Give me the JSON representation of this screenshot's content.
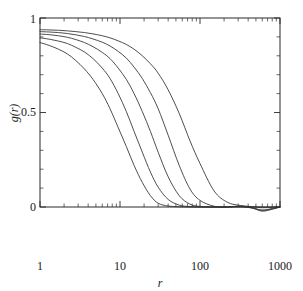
{
  "figure": {
    "background_color": "#ffffff",
    "line_color": "#3a3a3a",
    "axis_color": "#2a2a2a",
    "width": 303,
    "height": 291
  },
  "labels": {
    "xaxis": "r",
    "yaxis": "g(r)",
    "xtick_1": "1",
    "xtick_10": "10",
    "xtick_100": "100",
    "xtick_1000": "1000",
    "ytick_0": "0",
    "ytick_05": "0.5",
    "ytick_1": "1"
  },
  "chart_data": {
    "type": "line",
    "title": "",
    "xlabel": "r",
    "ylabel": "g(r)",
    "xscale": "log",
    "yscale": "linear",
    "xlim": [
      1,
      1000
    ],
    "ylim": [
      -0.07,
      1.0
    ],
    "xticks": [
      1,
      10,
      100,
      1000
    ],
    "xticklabels": [
      "1",
      "10",
      "100",
      "1000"
    ],
    "yticks": [
      0,
      0.5,
      1
    ],
    "yticklabels": [
      "0",
      "0.5",
      "1"
    ],
    "grid": false,
    "legend": null,
    "minor_ticks": true,
    "tick_direction": "in",
    "frame": "box",
    "series": [
      {
        "name": "curve-1",
        "comment": "leftmost / fastest decaying, half-value near r=7",
        "x": [
          1,
          1.3,
          1.7,
          2.2,
          2.8,
          3.6,
          4.6,
          6,
          7.5,
          9.5,
          12,
          15,
          19,
          24,
          30,
          40,
          55,
          75,
          100,
          150,
          220,
          320,
          450,
          600,
          800,
          1000
        ],
        "y": [
          0.87,
          0.855,
          0.835,
          0.81,
          0.775,
          0.73,
          0.675,
          0.6,
          0.52,
          0.42,
          0.32,
          0.22,
          0.13,
          0.06,
          0.02,
          0.005,
          0.001,
          0.0,
          0.0,
          0.0,
          0.0,
          0.0,
          0.0,
          -0.004,
          -0.002,
          0.0
        ]
      },
      {
        "name": "curve-2",
        "comment": "half-value near r=12",
        "x": [
          1,
          1.3,
          1.7,
          2.2,
          2.8,
          3.6,
          4.6,
          6,
          7.5,
          9.5,
          12,
          15,
          19,
          24,
          30,
          40,
          55,
          75,
          100,
          150,
          220,
          320,
          450,
          600,
          800,
          1000
        ],
        "y": [
          0.895,
          0.888,
          0.878,
          0.865,
          0.845,
          0.82,
          0.785,
          0.735,
          0.68,
          0.6,
          0.505,
          0.4,
          0.29,
          0.185,
          0.105,
          0.04,
          0.01,
          0.002,
          0.0,
          0.0,
          0.0,
          0.002,
          -0.005,
          -0.018,
          -0.01,
          0.0
        ]
      },
      {
        "name": "curve-3",
        "comment": "half-value near r=22",
        "x": [
          1,
          1.3,
          1.7,
          2.2,
          2.8,
          3.6,
          4.6,
          6,
          7.5,
          9.5,
          12,
          15,
          19,
          24,
          30,
          40,
          55,
          75,
          100,
          150,
          220,
          320,
          450,
          600,
          800,
          1000
        ],
        "y": [
          0.915,
          0.912,
          0.906,
          0.898,
          0.886,
          0.87,
          0.848,
          0.818,
          0.785,
          0.735,
          0.675,
          0.6,
          0.505,
          0.4,
          0.29,
          0.16,
          0.06,
          0.015,
          0.003,
          0.0,
          0.0,
          0.004,
          -0.006,
          -0.022,
          -0.012,
          0.0
        ]
      },
      {
        "name": "curve-4",
        "comment": "half-value near r=40",
        "x": [
          1,
          1.3,
          1.7,
          2.2,
          2.8,
          3.6,
          4.6,
          6,
          7.5,
          9.5,
          12,
          15,
          19,
          24,
          30,
          40,
          55,
          75,
          100,
          150,
          220,
          320,
          450,
          600,
          800,
          1000
        ],
        "y": [
          0.928,
          0.926,
          0.923,
          0.918,
          0.911,
          0.902,
          0.889,
          0.872,
          0.852,
          0.823,
          0.788,
          0.74,
          0.68,
          0.605,
          0.52,
          0.38,
          0.22,
          0.095,
          0.035,
          0.004,
          0.0,
          0.005,
          -0.004,
          -0.016,
          -0.008,
          0.0
        ]
      },
      {
        "name": "curve-5",
        "comment": "rightmost / slowest decaying, half-value near r=85",
        "x": [
          1,
          1.3,
          1.7,
          2.2,
          2.8,
          3.6,
          4.6,
          6,
          7.5,
          9.5,
          12,
          15,
          19,
          24,
          30,
          40,
          55,
          75,
          100,
          150,
          220,
          320,
          450,
          600,
          800,
          1000
        ],
        "y": [
          0.938,
          0.937,
          0.935,
          0.932,
          0.928,
          0.923,
          0.916,
          0.906,
          0.895,
          0.879,
          0.86,
          0.835,
          0.8,
          0.758,
          0.708,
          0.62,
          0.495,
          0.35,
          0.23,
          0.085,
          0.025,
          0.008,
          0.002,
          0.0,
          0.0,
          0.0
        ]
      }
    ]
  }
}
